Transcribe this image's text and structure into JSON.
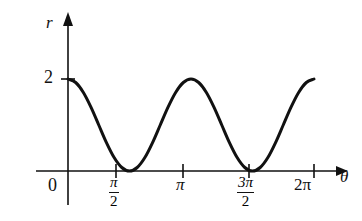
{
  "figure": {
    "background_color": "#ffffff",
    "ink_color": "#111111"
  },
  "axes": {
    "y_axis_label": "r",
    "x_axis_label": "θ",
    "origin_label": "0",
    "y_tick_label": "2"
  },
  "x_ticks": [
    {
      "id": "pi-over-2",
      "numerator": "π",
      "denominator": "2",
      "value_label": "π/2"
    },
    {
      "id": "pi",
      "label": "π",
      "value_label": "π"
    },
    {
      "id": "3pi-over-2",
      "numerator": "3π",
      "denominator": "2",
      "value_label": "3π/2"
    },
    {
      "id": "2pi",
      "label": "2π",
      "value_label": "2π"
    }
  ],
  "chart_data": {
    "type": "line",
    "title": "",
    "subtitle": "",
    "xlabel": "θ",
    "ylabel": "r",
    "function": "r = 1 + cos(2θ)",
    "equivalent_form": "r = 2cos²(θ)",
    "xlim": [
      0,
      6.283185307179586
    ],
    "ylim": [
      0,
      2.2
    ],
    "grid": false,
    "legend": false,
    "legend_position": "none",
    "x_tick_values": [
      0,
      1.5707963267948966,
      3.141592653589793,
      4.71238898038469,
      6.283185307179586
    ],
    "x_tick_labels": [
      "0",
      "π/2",
      "π",
      "3π/2",
      "2π"
    ],
    "y_tick_values": [
      2
    ],
    "y_tick_labels": [
      "2"
    ],
    "annotations": [],
    "series": [
      {
        "name": "r = 1 + cos(2θ)",
        "color": "#111111",
        "line_width": 3,
        "x": [
          0,
          0.1963,
          0.3927,
          0.589,
          0.7854,
          0.9817,
          1.1781,
          1.3744,
          1.5708,
          1.7671,
          1.9635,
          2.1598,
          2.3562,
          2.5525,
          2.7489,
          2.9452,
          3.1416,
          3.3379,
          3.5343,
          3.7306,
          3.927,
          4.1233,
          4.3197,
          4.516,
          4.7124,
          4.9087,
          5.1051,
          5.3014,
          5.4978,
          5.6941,
          5.8905,
          6.0868,
          6.2832
        ],
        "y": [
          2.0,
          1.9239,
          1.7071,
          1.3827,
          1.0,
          0.6173,
          0.2929,
          0.0761,
          0.0,
          0.0761,
          0.2929,
          0.6173,
          1.0,
          1.3827,
          1.7071,
          1.9239,
          2.0,
          1.9239,
          1.7071,
          1.3827,
          1.0,
          0.6173,
          0.2929,
          0.0761,
          0.0,
          0.0761,
          0.2929,
          0.6173,
          1.0,
          1.3827,
          1.7071,
          1.9239,
          2.0
        ],
        "maxima": [
          {
            "x_label": "0",
            "y": 2
          },
          {
            "x_label": "π",
            "y": 2
          },
          {
            "x_label": "2π",
            "y": 2
          }
        ],
        "minima": [
          {
            "x_label": "π/2",
            "y": 0
          },
          {
            "x_label": "3π/2",
            "y": 0
          }
        ]
      }
    ]
  }
}
